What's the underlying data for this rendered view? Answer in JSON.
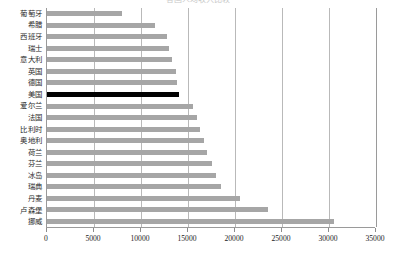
{
  "chart_data": {
    "type": "bar",
    "orientation": "horizontal",
    "title": "各国人均收入比较",
    "xlabel": "",
    "ylabel": "",
    "xlim": [
      0,
      35000
    ],
    "xticks": [
      0,
      5000,
      10000,
      15000,
      20000,
      25000,
      30000,
      35000
    ],
    "xtick_labels": [
      "0",
      "5000",
      "10000",
      "15000",
      "20000",
      "25000",
      "30000",
      "35000"
    ],
    "grid": true,
    "legend": false,
    "categories": [
      "葡萄牙",
      "希腊",
      "西班牙",
      "瑞士",
      "意大利",
      "英国",
      "德国",
      "美国",
      "爱尔兰",
      "法国",
      "比利时",
      "奥地利",
      "荷兰",
      "芬兰",
      "冰岛",
      "瑞典",
      "丹麦",
      "卢森堡",
      "挪威"
    ],
    "values": [
      8000,
      11500,
      12800,
      13000,
      13300,
      13700,
      13800,
      14000,
      15500,
      16000,
      16300,
      16700,
      17000,
      17500,
      18000,
      18500,
      20500,
      23500,
      30500
    ],
    "highlight_category": "美国",
    "colors": {
      "bar": "#a6a6a6",
      "highlight_bar": "#000000",
      "gridline": "#b9b9b9",
      "axis": "#9a9a9a",
      "text": "#1a1a1a"
    }
  }
}
